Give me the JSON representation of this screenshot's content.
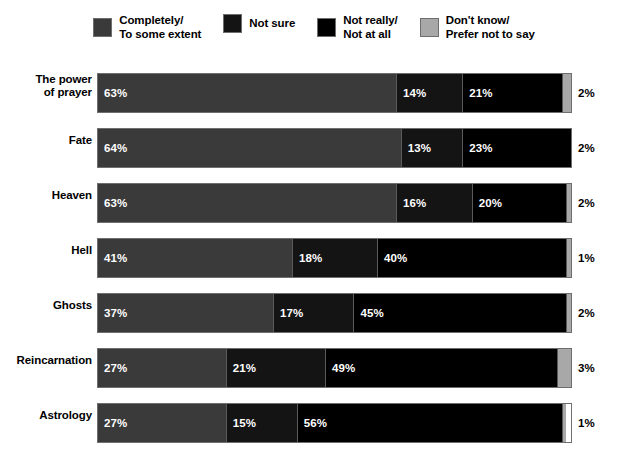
{
  "legend": {
    "items": [
      {
        "label": "Completely/\nTo some extent",
        "color": "#3a3a3a",
        "key": "completely_to_some_extent"
      },
      {
        "label": "Not sure",
        "color": "#141414",
        "key": "not_sure"
      },
      {
        "label": "Not really/\nNot at all",
        "color": "#000000",
        "key": "not_really_not_at_all"
      },
      {
        "label": "Don't know/\nPrefer not to say",
        "color": "#a8a8a8",
        "key": "dont_know_prefer_not_to_say"
      }
    ]
  },
  "chart_data": {
    "type": "bar",
    "subtype": "stacked-horizontal-100pct",
    "title": "",
    "subtitle": "",
    "xlabel": "",
    "ylabel": "",
    "xlim": [
      0,
      100
    ],
    "grid": false,
    "legend_position": "top",
    "value_suffix": "%",
    "categories": [
      "The power\nof prayer",
      "Fate",
      "Heaven",
      "Hell",
      "Ghosts",
      "Reincarnation",
      "Astrology"
    ],
    "series": [
      {
        "name": "Completely/To some extent",
        "color": "#3a3a3a",
        "values": [
          63,
          64,
          63,
          41,
          37,
          27,
          27
        ],
        "labels": [
          "63%",
          "64%",
          "63%",
          "41%",
          "37%",
          "27%",
          "27%"
        ]
      },
      {
        "name": "Not sure",
        "color": "#141414",
        "values": [
          14,
          13,
          16,
          18,
          17,
          21,
          15
        ],
        "labels": [
          "14%",
          "13%",
          "16%",
          "18%",
          "17%",
          "21%",
          "15%"
        ]
      },
      {
        "name": "Not really/Not at all",
        "color": "#000000",
        "values": [
          21,
          23,
          20,
          40,
          45,
          49,
          56
        ],
        "labels": [
          "21%",
          "23%",
          "20%",
          "40%",
          "45%",
          "49%",
          "56%"
        ]
      },
      {
        "name": "Don't know/Prefer not to say",
        "color": "#a8a8a8",
        "values": [
          2,
          2,
          2,
          1,
          2,
          3,
          1
        ],
        "labels": [
          "2%",
          "2%",
          "2%",
          "1%",
          "2%",
          "3%",
          "1%"
        ]
      }
    ]
  }
}
